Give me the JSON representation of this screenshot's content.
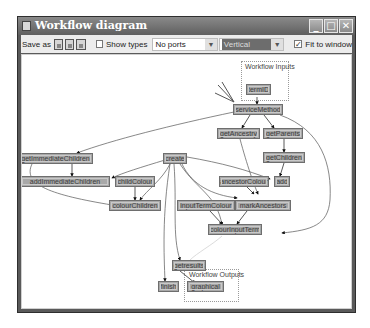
{
  "window": {
    "title": "Workflow diagram",
    "controls": {
      "minimize": "_",
      "maximize": "□",
      "close": "✕"
    }
  },
  "toolbar": {
    "save_label": "Save as",
    "save_formats": [
      "dot-icon",
      "png-icon",
      "svg-icon"
    ],
    "show_types": {
      "label": "Show types",
      "checked": false
    },
    "ports_select": {
      "value": "No ports"
    },
    "orientation_select": {
      "value": "Vertical"
    },
    "fit_to_window": {
      "label": "Fit to window",
      "checked": true,
      "mark": "✓"
    }
  },
  "diagram": {
    "groups": {
      "inputs": {
        "label": "Workflow Inputs"
      },
      "outputs": {
        "label": "Workflow Outputs"
      }
    },
    "nodes": {
      "termID": "termID",
      "serviceMethod": "serviceMethod",
      "getAncestry": "getAncestry",
      "getParents": "getParents",
      "getChildren": "getChildren",
      "getImmediateChildren": "getImmediateChildren",
      "create": "create",
      "addImmediateChildren": "addImmediateChildren",
      "childColour": "childColour",
      "ancestorColour": "ancestorColour",
      "add": "add",
      "colourChildren": "colourChildren",
      "inputTermColour": "inputTermColour",
      "markAncestors": "markAncestors",
      "colourInputTerm": "colourInputTerm",
      "getresults": "getresults",
      "finish": "finish",
      "graphical": "graphical"
    }
  },
  "colors": {
    "titlebar": "#6a6a6a",
    "node_fill": "#a8a8a8",
    "node_border": "#6e6e6e",
    "canvas": "#ffffff",
    "toolbar": "#ececec"
  }
}
